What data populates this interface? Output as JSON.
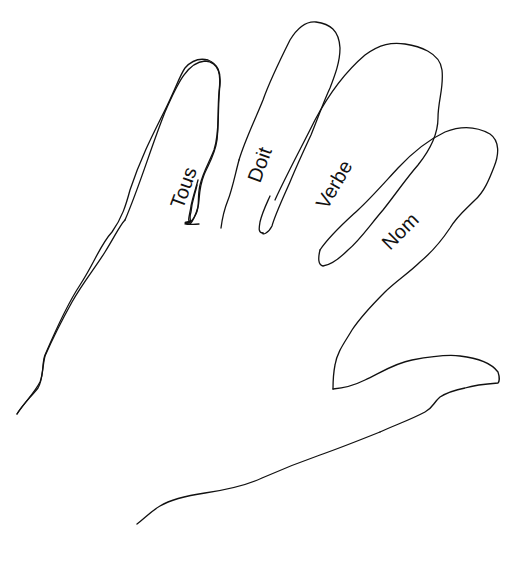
{
  "diagram": {
    "type": "hand-outline",
    "stroke_color": "#111111",
    "background_color": "#ffffff",
    "fingers": [
      {
        "id": "index",
        "label": "Tous"
      },
      {
        "id": "middle",
        "label": "Doit"
      },
      {
        "id": "ring",
        "label": "Verbe"
      },
      {
        "id": "pinky",
        "label": "Nom"
      }
    ]
  }
}
